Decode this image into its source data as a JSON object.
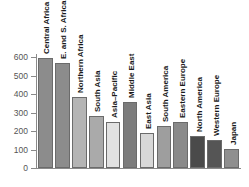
{
  "chart_data": {
    "type": "bar",
    "title": "",
    "subtitle": "",
    "xlabel": "",
    "ylabel": "",
    "ylim": [
      0,
      600
    ],
    "yticks": [
      0,
      100,
      200,
      300,
      400,
      500,
      600
    ],
    "grid": false,
    "legend": false,
    "categories": [
      "Central Africa",
      "E. and S. Africa",
      "Northern Africa",
      "South Asia",
      "Asia–Pacific",
      "Middle East",
      "East Asia",
      "South America",
      "Eastern Europe",
      "North America",
      "Western Europe",
      "Japan"
    ],
    "values": [
      595,
      565,
      385,
      283,
      250,
      355,
      190,
      225,
      250,
      172,
      150,
      103
    ],
    "bar_colors": [
      "#8c8c8c",
      "#8c8c8c",
      "#b4b4b4",
      "#aaaaaa",
      "#e2e2e2",
      "#7c7c7c",
      "#d8d8d8",
      "#9e9e9e",
      "#8a8a8a",
      "#4a4a4a",
      "#555555",
      "#8f8f8f"
    ]
  },
  "axis": {
    "tick_labels": [
      "600",
      "500",
      "400",
      "300",
      "200",
      "100",
      "0"
    ]
  }
}
